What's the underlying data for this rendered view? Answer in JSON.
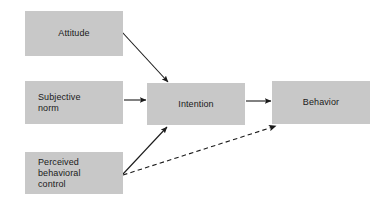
{
  "diagram": {
    "background_color": "#ffffff",
    "node_fill_color": "#c8c8c8",
    "text_color": "#1a1a1a",
    "edge_color": "#1a1a1a",
    "nodes": [
      {
        "id": "attitude",
        "label": "Attitude",
        "x": 25,
        "y": 11,
        "width": 98,
        "height": 45,
        "align": "center"
      },
      {
        "id": "subjective-norm",
        "label": "Subjective\nnorm",
        "x": 25,
        "y": 81,
        "width": 98,
        "height": 43,
        "align": "left"
      },
      {
        "id": "perceived-behavioral-control",
        "label": "Perceived\nbehavioral\ncontrol",
        "x": 25,
        "y": 152,
        "width": 98,
        "height": 42,
        "align": "left"
      },
      {
        "id": "intention",
        "label": "Intention",
        "x": 147,
        "y": 83,
        "width": 98,
        "height": 42,
        "align": "center"
      },
      {
        "id": "behavior",
        "label": "Behavior",
        "x": 272,
        "y": 81,
        "width": 98,
        "height": 43,
        "align": "center"
      }
    ],
    "edges": [
      {
        "id": "attitude-to-intention",
        "from": "attitude",
        "to": "intention",
        "style": "solid",
        "x1": 122,
        "y1": 32,
        "x2": 168,
        "y2": 82
      },
      {
        "id": "subjective-norm-to-intention",
        "from": "subjective-norm",
        "to": "intention",
        "style": "solid",
        "x1": 124,
        "y1": 100,
        "x2": 146,
        "y2": 100
      },
      {
        "id": "perceived-behavioral-control-to-intention",
        "from": "perceived-behavioral-control",
        "to": "intention",
        "style": "solid",
        "x1": 123,
        "y1": 174,
        "x2": 167,
        "y2": 127
      },
      {
        "id": "intention-to-behavior",
        "from": "intention",
        "to": "behavior",
        "style": "solid",
        "x1": 246,
        "y1": 101,
        "x2": 271,
        "y2": 101
      },
      {
        "id": "perceived-behavioral-control-to-behavior",
        "from": "perceived-behavioral-control",
        "to": "behavior",
        "style": "dashed",
        "x1": 123,
        "y1": 175,
        "x2": 276,
        "y2": 126
      }
    ]
  }
}
